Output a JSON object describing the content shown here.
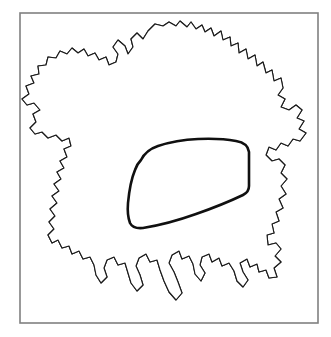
{
  "figure": {
    "kind": "scientific-line-drawing",
    "caption": "",
    "background_color": "#ffffff",
    "frame": {
      "visible": true,
      "color": "#808080",
      "stroke_width": 1.6,
      "x": 20,
      "y": 13,
      "width": 298,
      "height": 310
    },
    "ink_color": "#1b1b1b",
    "nucleus_ink_color": "#101010",
    "granule_color": "#2a2a2a"
  },
  "structures": [
    {
      "id": "cell-body",
      "label": "cell body outline",
      "description": "irregular ruffled perimeter with lobes, lamellipodial ruffles and filopodia",
      "stroke": "#1b1b1b",
      "stroke_width": 1.15,
      "fill": "#ffffff"
    },
    {
      "id": "nucleus",
      "label": "nucleus outline",
      "description": "thick dark rounded polygon in the centre-right of the cell",
      "stroke": "#101010",
      "stroke_width": 2.6,
      "fill": "none"
    },
    {
      "id": "cytoplasmic-granules",
      "label": "cytoplasmic granules",
      "description": "dense stipple of small open circles filling the entire cytoplasm and nucleus",
      "stroke": "#2a2a2a",
      "count": 2600
    }
  ],
  "geometry": {
    "cell_outline_path": "M 148 31 L 155 24 L 163 26 L 169 22 L 176 26 L 180 21 L 187 27 L 191 22 L 196 29 L 202 25 L 205 32 L 211 28 L 214 36 L 221 31 L 223 40 L 230 37 L 231 46 L 238 43 L 239 53 L 246 49 L 248 59 L 255 55 L 257 66 L 263 62 L 266 73 L 272 70 L 274 81 L 281 78 L 283 88 L 278 95 L 285 99 L 281 107 L 289 110 L 296 105 L 302 110 L 297 118 L 304 121 L 299 129 L 306 133 L 300 141 L 293 139 L 288 146 L 281 143 L 276 150 L 269 147 L 266 155 L 272 161 L 279 159 L 285 165 L 281 173 L 287 179 L 281 186 L 286 194 L 279 199 L 283 208 L 276 212 L 279 221 L 272 224 L 274 233 L 267 235 L 268 245 L 276 243 L 281 249 L 275 256 L 281 262 L 274 268 L 277 277 L 269 278 L 266 270 L 259 272 L 257 264 L 250 267 L 247 259 L 240 263 L 243 272 L 248 280 L 243 287 L 237 281 L 234 271 L 229 263 L 222 266 L 219 258 L 212 262 L 209 254 L 202 257 L 200 265 L 205 273 L 201 281 L 195 274 L 193 264 L 189 256 L 182 259 L 179 251 L 172 255 L 169 263 L 174 272 L 178 282 L 182 293 L 176 300 L 169 292 L 164 281 L 160 270 L 157 260 L 150 262 L 146 254 L 139 258 L 136 266 L 140 275 L 143 285 L 137 291 L 131 283 L 128 273 L 125 263 L 118 265 L 114 257 L 107 260 L 104 268 L 107 277 L 101 283 L 96 275 L 94 265 L 90 257 L 83 259 L 79 251 L 72 254 L 69 246 L 62 248 L 58 240 L 52 243 L 48 235 L 54 229 L 49 222 L 55 216 L 50 209 L 57 203 L 52 196 L 59 191 L 54 184 L 61 179 L 57 172 L 64 168 L 60 161 L 67 157 L 64 149 L 71 146 L 69 138 L 62 141 L 56 135 L 48 138 L 42 132 L 35 134 L 30 128 L 36 122 L 33 114 L 40 110 L 34 103 L 27 105 L 22 99 L 29 94 L 26 86 L 34 83 L 31 76 L 39 74 L 38 66 L 46 65 L 48 57 L 56 58 L 60 51 L 67 54 L 72 48 L 78 53 L 84 49 L 88 56 L 95 53 L 99 60 L 106 57 L 109 65 L 116 62 L 118 54 L 113 47 L 118 40 L 125 46 L 128 54 L 133 47 L 131 39 L 137 33 L 143 39 Z",
    "nucleus_outline_path": "M 141 160 Q 146 150 158 146 Q 176 140 198 139 Q 220 138 236 141 Q 248 143 249 152 L 249 186 Q 249 192 243 195 Q 222 205 196 214 Q 168 224 143 228 Q 133 229 130 223 Q 127 215 128 203 Q 130 182 135 170 Q 137 164 141 160 Z"
  },
  "texture": {
    "granule_seed": 20250614,
    "granule_count": 2600,
    "granule_radius_min": 1.1,
    "granule_radius_max": 2.6,
    "dark_dot_fraction": 0.16
  }
}
